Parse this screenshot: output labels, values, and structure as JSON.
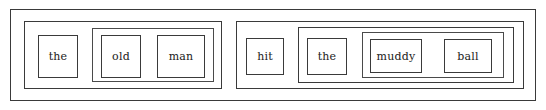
{
  "diagram": {
    "type": "constituency-box-diagram",
    "sentence": "the old man hit the muddy ball",
    "notation": "nested boxes",
    "colors": {
      "background": "#ffffff",
      "border": "#3a3a3a",
      "inner_border": "#4a4a4a",
      "text": "#1a1a1a"
    },
    "sentence_box": {
      "name": "S",
      "children": [
        "subject_np",
        "predicate_vp"
      ]
    },
    "subject_np": {
      "name": "NP",
      "determiner": {
        "word": "the"
      },
      "nbar": {
        "name": "N-bar",
        "adjective": {
          "word": "old"
        },
        "noun": {
          "word": "man"
        }
      }
    },
    "predicate_vp": {
      "name": "VP",
      "verb": {
        "word": "hit"
      },
      "object_np": {
        "name": "NP",
        "determiner": {
          "word": "the"
        },
        "nbar": {
          "name": "N-bar",
          "adjective": {
            "word": "muddy"
          },
          "noun": {
            "word": "ball"
          }
        }
      }
    },
    "words": [
      {
        "text": "the",
        "role": "determiner"
      },
      {
        "text": "old",
        "role": "adjective"
      },
      {
        "text": "man",
        "role": "noun"
      },
      {
        "text": "hit",
        "role": "verb"
      },
      {
        "text": "the",
        "role": "determiner"
      },
      {
        "text": "muddy",
        "role": "adjective"
      },
      {
        "text": "ball",
        "role": "noun"
      }
    ]
  }
}
